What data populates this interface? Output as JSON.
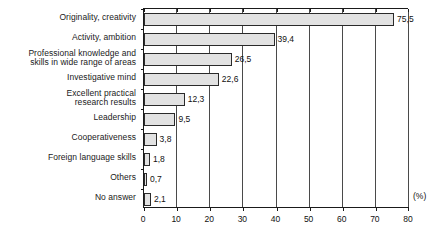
{
  "chart_data": {
    "type": "bar",
    "orientation": "horizontal",
    "title": "",
    "xlabel": "",
    "ylabel": "",
    "unit_label": "(%)",
    "xlim": [
      0,
      80
    ],
    "xticks": [
      0,
      10,
      20,
      30,
      40,
      50,
      60,
      70,
      80
    ],
    "xtick_labels": [
      "0",
      "10",
      "20",
      "30",
      "40",
      "50",
      "60",
      "70",
      "80"
    ],
    "grid": "vertical",
    "legend": "none",
    "decimal_separator": ",",
    "categories": [
      "Originality, creativity",
      "Activity, ambition",
      "Professional knowledge and skills in wide range of areas",
      "Investigative mind",
      "Excellent practical research results",
      "Leadership",
      "Cooperativeness",
      "Foreign language skills",
      "Others",
      "No answer"
    ],
    "category_lines": [
      [
        "Originality, creativity"
      ],
      [
        "Activity, ambition"
      ],
      [
        "Professional knowledge and",
        "skills in wide range of areas"
      ],
      [
        "Investigative mind"
      ],
      [
        "Excellent practical",
        "research results"
      ],
      [
        "Leadership"
      ],
      [
        "Cooperativeness"
      ],
      [
        "Foreign language skills"
      ],
      [
        "Others"
      ],
      [
        "No answer"
      ]
    ],
    "values": [
      75.5,
      39.4,
      26.5,
      22.6,
      12.3,
      9.5,
      3.8,
      1.8,
      0.7,
      2.1
    ],
    "value_labels": [
      "75,5",
      "39,4",
      "26,5",
      "22,6",
      "12,3",
      "9,5",
      "3,8",
      "1,8",
      "0,7",
      "2,1"
    ],
    "colors": {
      "bar_fill": "#e2e2e2",
      "bar_border": "#2a2a2a",
      "axis": "#1a1a1a",
      "gridline": "#4a4a4a",
      "text": "#111111",
      "background": "#ffffff"
    }
  }
}
